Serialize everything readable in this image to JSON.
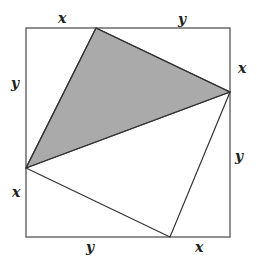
{
  "diagram": {
    "square": {
      "x0": 26,
      "y0": 28,
      "x1": 230,
      "y1": 237,
      "stroke": "#555555"
    },
    "points": {
      "top": [
        96,
        28
      ],
      "right": [
        230,
        92
      ],
      "left": [
        26,
        168
      ],
      "bottom": [
        170,
        237
      ]
    },
    "shaded_triangle_fill": "#aaaaaa",
    "labels": {
      "top_left": "x",
      "top_right": "y",
      "right_top": "x",
      "right_bottom": "y",
      "left_top": "y",
      "left_bottom": "x",
      "bottom_left": "y",
      "bottom_right": "x"
    }
  }
}
